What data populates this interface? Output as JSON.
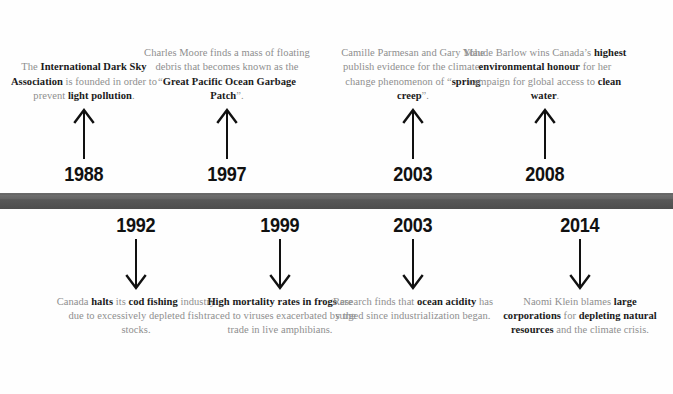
{
  "theme": {
    "bar_color": "#585858",
    "body_text_color": "#8e8e8e",
    "emphasis_text_color": "#1a1a1a",
    "year_color": "#111111",
    "background": "#ffffff"
  },
  "timeline": {
    "orientation": "horizontal",
    "above_events": [
      {
        "year": "1988",
        "center_x": 84,
        "text_runs": [
          {
            "t": "The ",
            "b": false
          },
          {
            "t": "International Dark Sky Association",
            "b": true
          },
          {
            "t": " is founded in order to prevent ",
            "b": false
          },
          {
            "t": "light pollution",
            "b": true
          },
          {
            "t": ".",
            "b": false
          }
        ],
        "plain_text": "The International Dark Sky Association is founded in order to prevent light pollution."
      },
      {
        "year": "1997",
        "center_x": 227,
        "text_runs": [
          {
            "t": "Charles Moore finds a mass of floating debris that becomes known as the “",
            "b": false
          },
          {
            "t": "Great Pacific Ocean Garbage Patch",
            "b": true
          },
          {
            "t": "”.",
            "b": false
          }
        ],
        "plain_text": "Charles Moore finds a mass of floating debris that becomes known as the “Great Pacific Ocean Garbage Patch”."
      },
      {
        "year": "2003",
        "center_x": 413,
        "text_runs": [
          {
            "t": "Camille Parmesan and Gary Yohe publish evidence for the climate-change phenomenon of “",
            "b": false
          },
          {
            "t": "spring creep",
            "b": true
          },
          {
            "t": "”.",
            "b": false
          }
        ],
        "plain_text": "Camille Parmesan and Gary Yohe publish evidence for the climate-change phenomenon of “spring creep”."
      },
      {
        "year": "2008",
        "center_x": 545,
        "text_runs": [
          {
            "t": "Maude Barlow wins Canada’s ",
            "b": false
          },
          {
            "t": "highest environmental honour",
            "b": true
          },
          {
            "t": " for her campaign for global access to ",
            "b": false
          },
          {
            "t": "clean water",
            "b": true
          },
          {
            "t": ".",
            "b": false
          }
        ],
        "plain_text": "Maude Barlow wins Canada’s highest environmental honour for her campaign for global access to clean water."
      }
    ],
    "below_events": [
      {
        "year": "1992",
        "center_x": 136,
        "text_runs": [
          {
            "t": "Canada ",
            "b": false
          },
          {
            "t": "halts",
            "b": true
          },
          {
            "t": " its ",
            "b": false
          },
          {
            "t": "cod fishing",
            "b": true
          },
          {
            "t": " industry due to excessively depleted fish stocks.",
            "b": false
          }
        ],
        "plain_text": "Canada halts its cod fishing industry due to excessively depleted fish stocks."
      },
      {
        "year": "1999",
        "center_x": 280,
        "text_runs": [
          {
            "t": "High mortality rates in frogs",
            "b": true
          },
          {
            "t": " are traced to viruses exacerbated by the trade in live amphibians.",
            "b": false
          }
        ],
        "plain_text": "High mortality rates in frogs are traced to viruses exacerbated by the trade in live amphibians."
      },
      {
        "year": "2003",
        "center_x": 413,
        "text_runs": [
          {
            "t": "Research finds that ",
            "b": false
          },
          {
            "t": "ocean acidity",
            "b": true
          },
          {
            "t": " has surged since industrialization began.",
            "b": false
          }
        ],
        "plain_text": "Research finds that ocean acidity has surged since industrialization began."
      },
      {
        "year": "2014",
        "center_x": 580,
        "text_runs": [
          {
            "t": "Naomi Klein blames ",
            "b": false
          },
          {
            "t": "large corporations",
            "b": true
          },
          {
            "t": " for ",
            "b": false
          },
          {
            "t": "depleting natural resources",
            "b": true
          },
          {
            "t": " and the climate crisis.",
            "b": false
          }
        ],
        "plain_text": "Naomi Klein blames large corporations for depleting natural resources and the climate crisis."
      }
    ]
  }
}
